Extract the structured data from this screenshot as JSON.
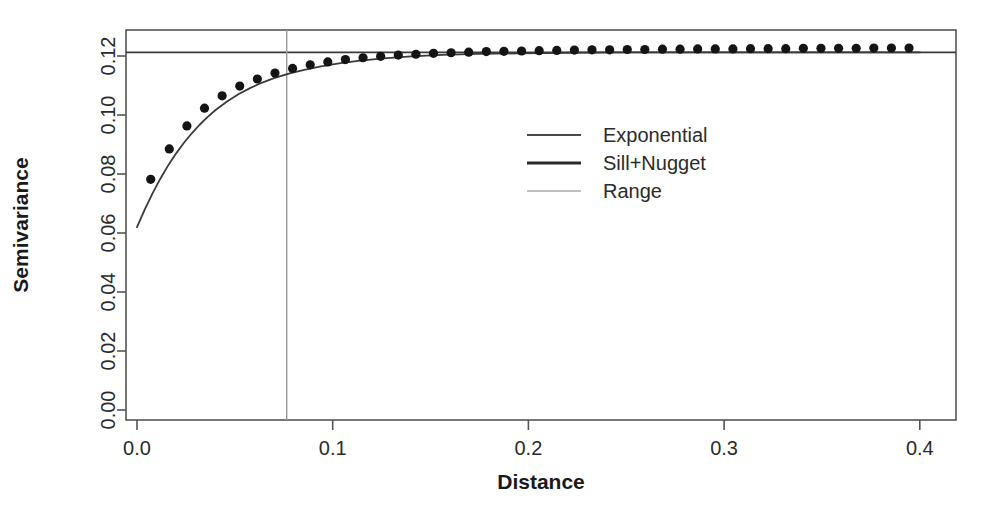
{
  "chart_data": {
    "type": "scatter",
    "title": "",
    "xlabel": "Distance",
    "ylabel": "Semivariance",
    "xlim": [
      -0.012,
      0.417
    ],
    "ylim": [
      -0.004,
      0.1285
    ],
    "xticks": [
      0.0,
      0.1,
      0.2,
      0.3,
      0.4
    ],
    "xticklabels": [
      "0.0",
      "0.1",
      "0.2",
      "0.3",
      "0.4"
    ],
    "yticks": [
      0.0,
      0.02,
      0.04,
      0.06,
      0.08,
      0.1,
      0.12
    ],
    "yticklabels": [
      "0.00",
      "0.02",
      "0.04",
      "0.06",
      "0.08",
      "0.10",
      "0.12"
    ],
    "grid": false,
    "legend_position": "center",
    "legend": [
      {
        "label": "Exponential",
        "kind": "line",
        "color": "#4a4a4a"
      },
      {
        "label": "Sill+Nugget",
        "kind": "line",
        "color": "#2a2a2a"
      },
      {
        "label": "Range",
        "kind": "line",
        "color": "#aaaaaa"
      }
    ],
    "annotations": {
      "nugget": 0.0605,
      "sill_plus_nugget": 0.1212,
      "range": 0.0765,
      "model": "exponential"
    },
    "series": [
      {
        "name": "Empirical semivariogram",
        "kind": "points",
        "x": [
          0.007,
          0.0165,
          0.0255,
          0.0345,
          0.0435,
          0.0525,
          0.0615,
          0.0705,
          0.0795,
          0.0885,
          0.0975,
          0.1065,
          0.1155,
          0.1245,
          0.1335,
          0.1425,
          0.1515,
          0.1605,
          0.1695,
          0.1785,
          0.1875,
          0.1965,
          0.2055,
          0.2145,
          0.2235,
          0.2325,
          0.2415,
          0.2505,
          0.2595,
          0.2685,
          0.2775,
          0.2865,
          0.2955,
          0.3045,
          0.3135,
          0.3225,
          0.3315,
          0.3405,
          0.3495,
          0.3585,
          0.3675,
          0.3765,
          0.3855,
          0.3945
        ],
        "y": [
          0.0782,
          0.0885,
          0.0963,
          0.1023,
          0.1065,
          0.1098,
          0.1122,
          0.1142,
          0.1158,
          0.117,
          0.118,
          0.1188,
          0.1194,
          0.1199,
          0.1203,
          0.1206,
          0.1209,
          0.1211,
          0.1213,
          0.1215,
          0.1216,
          0.1217,
          0.1218,
          0.1219,
          0.122,
          0.1221,
          0.1221,
          0.1222,
          0.1222,
          0.1223,
          0.1223,
          0.1224,
          0.1224,
          0.1224,
          0.1225,
          0.1225,
          0.1225,
          0.1226,
          0.1226,
          0.1226,
          0.1226,
          0.1227,
          0.1227,
          0.1227
        ]
      },
      {
        "name": "Exponential",
        "kind": "curve",
        "x": [
          0.0,
          0.004,
          0.008,
          0.012,
          0.016,
          0.02,
          0.024,
          0.028,
          0.032,
          0.036,
          0.04,
          0.046,
          0.052,
          0.058,
          0.064,
          0.07,
          0.078,
          0.086,
          0.094,
          0.104,
          0.114,
          0.126,
          0.14,
          0.156,
          0.174,
          0.195,
          0.22,
          0.25,
          0.285,
          0.325,
          0.37,
          0.4
        ],
        "y": [
          0.062,
          0.068,
          0.0735,
          0.0785,
          0.083,
          0.087,
          0.0906,
          0.0938,
          0.0967,
          0.0993,
          0.1016,
          0.1046,
          0.1071,
          0.1092,
          0.111,
          0.1125,
          0.1141,
          0.1154,
          0.1165,
          0.1176,
          0.1184,
          0.1192,
          0.1199,
          0.1204,
          0.1207,
          0.1209,
          0.1211,
          0.1212,
          0.1212,
          0.1212,
          0.1212,
          0.1212
        ]
      }
    ]
  },
  "axis": {
    "x_title": "Distance",
    "y_title": "Semivariance"
  }
}
